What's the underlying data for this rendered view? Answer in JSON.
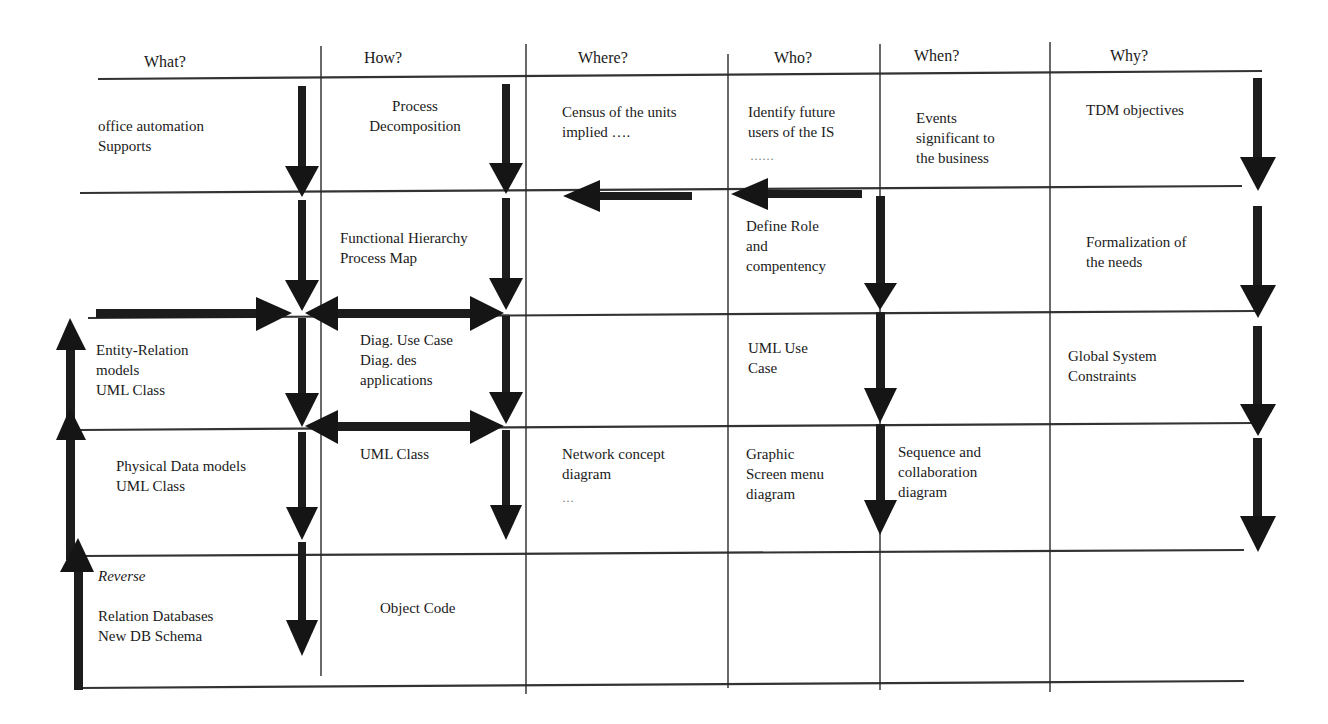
{
  "headers": [
    {
      "key": "what",
      "label": "What?"
    },
    {
      "key": "how",
      "label": "How?"
    },
    {
      "key": "where",
      "label": "Where?"
    },
    {
      "key": "who",
      "label": "Who?"
    },
    {
      "key": "when",
      "label": "When?"
    },
    {
      "key": "why",
      "label": "Why?"
    }
  ],
  "rows": [
    {
      "what": "office automation\nSupports",
      "how": "Process\nDecomposition",
      "where": "Census of the units\nimplied ….",
      "who": "Identify  future\nusers of the IS",
      "who_dots": "……",
      "when": "Events\nsignificant to\nthe business",
      "why": "TDM objectives"
    },
    {
      "what": "",
      "how": "Functional Hierarchy\nProcess Map",
      "where": "",
      "who": "Define Role\nand\ncompentency",
      "when": "",
      "why": "Formalization of\nthe needs"
    },
    {
      "what": "Entity-Relation\nmodels\nUML Class",
      "how": "Diag. Use Case\nDiag. des\napplications",
      "where": "",
      "who": "UML Use\nCase",
      "when": "",
      "why": "Global System\nConstraints"
    },
    {
      "what": "Physical Data models\nUML Class",
      "how": "UML Class",
      "where": "Network concept\ndiagram",
      "where_dots": "…",
      "who": "Graphic\nScreen menu\ndiagram",
      "when": "Sequence and\ncollaboration\ndiagram",
      "why": ""
    },
    {
      "what_label": "Reverse",
      "what": "Relation Databases\nNew DB Schema",
      "how": "Object Code",
      "where": "",
      "who": "",
      "when": "",
      "why": ""
    }
  ],
  "arrows": {
    "down": "down-arrow",
    "up": "up-arrow",
    "left": "left-arrow",
    "right": "right-arrow",
    "double": "double-headed-arrow"
  }
}
